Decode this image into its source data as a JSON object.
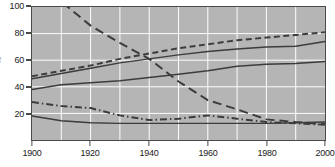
{
  "chart_data": {
    "type": "line",
    "title": "",
    "xlabel": "",
    "ylabel": "%",
    "xlim": [
      1900,
      2000
    ],
    "ylim": [
      0,
      100
    ],
    "grid": true,
    "legend": "none",
    "x_ticks": [
      1900,
      1920,
      1940,
      1960,
      1980,
      2000
    ],
    "y_ticks": [
      20,
      40,
      60,
      80,
      100
    ],
    "x_minor_step": 10,
    "background_color": "#b5b5b5",
    "gridline_color": "#ffffff",
    "line_color": "#3c3c3c",
    "frame_color": "#4a4a4a",
    "x": [
      1900,
      1910,
      1920,
      1930,
      1940,
      1950,
      1960,
      1970,
      1980,
      1990,
      2000
    ],
    "series": [
      {
        "name": "series-rising-dashed",
        "style": "dashed",
        "values": [
          48,
          52,
          56,
          61,
          65,
          69,
          72,
          75,
          77,
          79,
          81
        ]
      },
      {
        "name": "series-rising-solid-upper",
        "style": "solid",
        "values": [
          46,
          50,
          54,
          58,
          61,
          64,
          66.5,
          68.5,
          70,
          70.5,
          74
        ]
      },
      {
        "name": "series-rising-solid-lower",
        "style": "solid",
        "values": [
          38,
          41.5,
          43,
          44.5,
          47,
          49.5,
          52,
          55.5,
          57,
          57.5,
          59
        ]
      },
      {
        "name": "series-falling-longdash",
        "style": "long-dash",
        "values": [
          124,
          104,
          86,
          73,
          61,
          44,
          30,
          23,
          15.5,
          13.5,
          12
        ]
      },
      {
        "name": "series-falling-dashdot",
        "style": "dash-dot",
        "values": [
          28.5,
          25.5,
          24,
          18.5,
          15,
          16,
          18.5,
          16,
          13.5,
          12.5,
          11.5
        ]
      },
      {
        "name": "series-flat-solid",
        "style": "solid",
        "values": [
          18,
          14.5,
          13,
          12.5,
          12.5,
          12.5,
          12.5,
          12.5,
          12.5,
          13,
          13.5
        ]
      }
    ]
  },
  "axes": {
    "y_caption": "%",
    "x_tick_labels": [
      "1900",
      "1920",
      "1940",
      "1960",
      "1980",
      "2000"
    ],
    "y_tick_labels": [
      "20",
      "40",
      "60",
      "80",
      "100"
    ]
  }
}
